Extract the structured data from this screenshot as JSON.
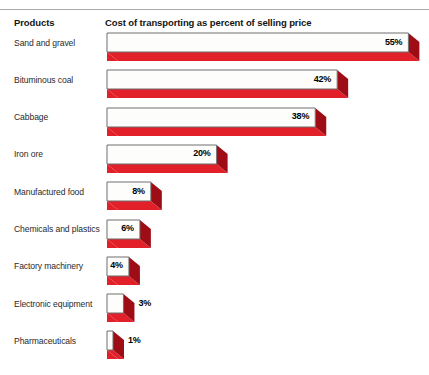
{
  "header": {
    "products_label": "Products",
    "metric_label": "Cost of transporting as percent of selling price"
  },
  "colors": {
    "bar_top_face": "#fdfdfb",
    "bar_front_face": "#e2202a",
    "bar_front_face_dark": "#c4121c",
    "bar_end_cap": "#9e0d16",
    "bar_outline": "#6e6e6e",
    "text": "#2a2a2a",
    "heading_text": "#141414",
    "rule": "#a9a9a9",
    "background": "#ffffff"
  },
  "chart_data": {
    "type": "bar",
    "orientation": "horizontal",
    "title": "Cost of transporting as percent of selling price",
    "xlabel": "Cost of transporting as percent of selling price",
    "ylabel": "Products",
    "grid": false,
    "legend": null,
    "xlim": [
      0,
      58
    ],
    "unit": "%",
    "categories": [
      "Sand and gravel",
      "Bituminous coal",
      "Cabbage",
      "Iron ore",
      "Manufactured food",
      "Chemicals and plastics",
      "Factory machinery",
      "Electronic equipment",
      "Pharmaceuticals"
    ],
    "values": [
      55,
      42,
      38,
      20,
      8,
      6,
      4,
      3,
      1
    ],
    "value_labels": [
      "55%",
      "42%",
      "38%",
      "20%",
      "8%",
      "6%",
      "4%",
      "3%",
      "1%"
    ],
    "label_placement": [
      "inside",
      "inside",
      "inside",
      "inside",
      "inside",
      "inside",
      "inside",
      "outside",
      "outside"
    ]
  },
  "rows": [
    {
      "label": "Sand and gravel",
      "value": 55,
      "value_label": "55%",
      "placement": "inside"
    },
    {
      "label": "Bituminous coal",
      "value": 42,
      "value_label": "42%",
      "placement": "inside"
    },
    {
      "label": "Cabbage",
      "value": 38,
      "value_label": "38%",
      "placement": "inside"
    },
    {
      "label": "Iron ore",
      "value": 20,
      "value_label": "20%",
      "placement": "inside"
    },
    {
      "label": "Manufactured food",
      "value": 8,
      "value_label": "8%",
      "placement": "inside"
    },
    {
      "label": "Chemicals and plastics",
      "value": 6,
      "value_label": "6%",
      "placement": "inside"
    },
    {
      "label": "Factory machinery",
      "value": 4,
      "value_label": "4%",
      "placement": "inside"
    },
    {
      "label": "Electronic equipment",
      "value": 3,
      "value_label": "3%",
      "placement": "outside"
    },
    {
      "label": "Pharmaceuticals",
      "value": 1,
      "value_label": "1%",
      "placement": "outside"
    }
  ]
}
